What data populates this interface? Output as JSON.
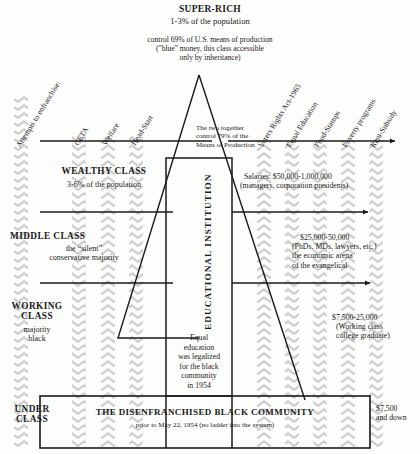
{
  "diagram": {
    "title": "SUPER-RICH",
    "title_sub": "1-3% of the population",
    "title_note": "control 69% of U.S. means of production\n(\"blue\" money, this class accessible\nonly by inheritance)",
    "apex_note": "The two together\ncontrol 79% of the\nMeans of Production",
    "center_box": {
      "vertical_label": "EDUCATIONAL INSTITUTION",
      "body": "Equal\neducation\nwas legalized\nfor the black\ncommunity\nin 1954"
    },
    "bottom_box": {
      "title": "THE DISENFRANCHISED BLACK COMMUNITY",
      "sub": "prior to May 22, 1954 (no ladder into the system)"
    },
    "classes": [
      {
        "name": "WEALTHY CLASS",
        "sub": "3-6% of the population"
      },
      {
        "name": "MIDDLE CLASS",
        "sub": "the “silent”\nconservative majority"
      },
      {
        "name": "WORKING\nCLASS",
        "sub": "majority\nblack"
      },
      {
        "name": "UNDER\nCLASS",
        "sub": ""
      }
    ],
    "income_notes": [
      {
        "line1": "Salaries: $50,000-1,000,000",
        "line2": "(managers, corporation presidents)"
      },
      {
        "line1": "$25,000-50,000",
        "line2": "(PhDs, MDs, lawyers, etc.)\nthe economic arena\nof the evangelical"
      },
      {
        "line1": "$7,500-25,000",
        "line2": "(Working class\ncollege graduate)"
      },
      {
        "line1": "$7,500",
        "line2": "and down"
      }
    ],
    "left_labels": [
      "Attempts to enfranchise:",
      "CETA",
      "Welfare",
      "Head-Start"
    ],
    "right_labels": [
      "Voters Rights Act-1965",
      "Equal Education",
      "Food-Stamps",
      "Poverty programs",
      "Rent-Subsidy"
    ],
    "colors": {
      "ink": "#1a1a1a",
      "band": "#cfcfcf",
      "paper": "#fdfdfc"
    }
  }
}
